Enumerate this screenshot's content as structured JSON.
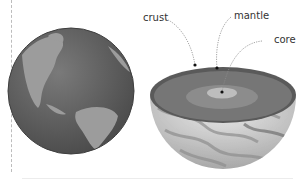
{
  "diagram": {
    "left_figure": "earth-globe",
    "right_figure": "earth-cutaway-half",
    "labels": {
      "crust": "crust",
      "mantle": "mantle",
      "core": "core"
    },
    "colors": {
      "globe_ocean": "#6b6b6b",
      "globe_land": "#9a9a9a",
      "crust": "#5e5e5e",
      "mantle": "#7a7a7a",
      "core": "#bdbdbd",
      "leader_line": "#8a8a8a"
    }
  }
}
